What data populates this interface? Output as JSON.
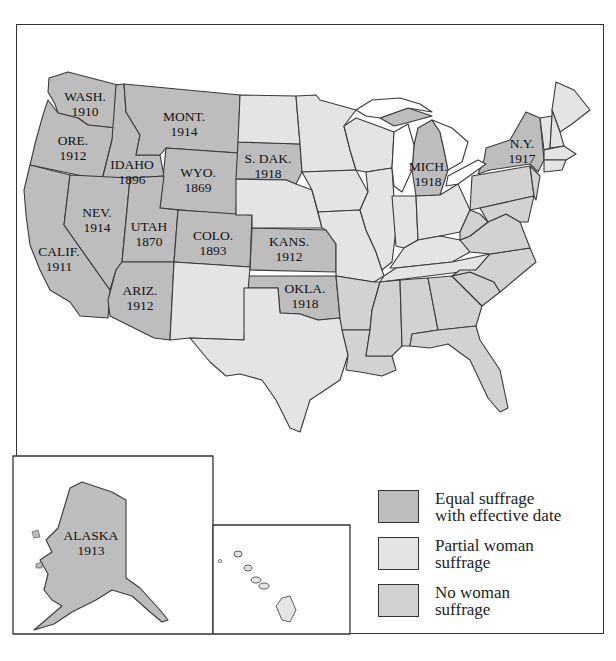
{
  "map": {
    "colors": {
      "equal": "#bdbdbd",
      "partial": "#e4e4e4",
      "none": "#d2d2d2",
      "border": "#3a3a3a",
      "water": "#ffffff"
    },
    "states_labeled": [
      {
        "abbr": "WASH.",
        "year": "1910"
      },
      {
        "abbr": "ORE.",
        "year": "1912"
      },
      {
        "abbr": "CALIF.",
        "year": "1911"
      },
      {
        "abbr": "IDAHO",
        "year": "1896"
      },
      {
        "abbr": "NEV.",
        "year": "1914"
      },
      {
        "abbr": "MONT.",
        "year": "1914"
      },
      {
        "abbr": "WYO.",
        "year": "1869"
      },
      {
        "abbr": "UTAH",
        "year": "1870"
      },
      {
        "abbr": "COLO.",
        "year": "1893"
      },
      {
        "abbr": "ARIZ.",
        "year": "1912"
      },
      {
        "abbr": "S. DAK.",
        "year": "1918"
      },
      {
        "abbr": "KANS.",
        "year": "1912"
      },
      {
        "abbr": "OKLA.",
        "year": "1918"
      },
      {
        "abbr": "MICH.",
        "year": "1918"
      },
      {
        "abbr": "N.Y.",
        "year": "1917"
      },
      {
        "abbr": "ALASKA",
        "year": "1913"
      }
    ]
  },
  "legend": {
    "items": [
      {
        "label_line1": "Equal suffrage",
        "label_line2": "with effective date",
        "category": "equal"
      },
      {
        "label_line1": "Partial woman",
        "label_line2": "suffrage",
        "category": "partial"
      },
      {
        "label_line1": "No woman",
        "label_line2": "suffrage",
        "category": "none"
      }
    ]
  }
}
